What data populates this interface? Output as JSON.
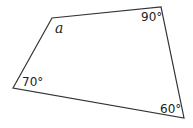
{
  "diagram": {
    "shape": "quadrilateral",
    "stroke_color": "#333333",
    "vertices": {
      "top_left": [
        52,
        18
      ],
      "top_right": [
        161,
        7
      ],
      "bottom_right": [
        184,
        118
      ],
      "bottom_left": [
        13,
        88
      ]
    },
    "angles": {
      "top_left": "a",
      "top_right": "90°",
      "bottom_right": "60°",
      "bottom_left": "70°"
    }
  }
}
